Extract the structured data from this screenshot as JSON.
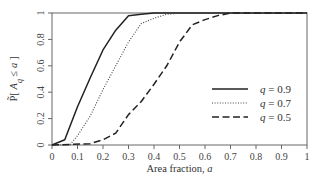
{
  "chart_data": {
    "type": "line",
    "title": "",
    "xlabel": "Area fraction, a",
    "xlabel_parts": {
      "text": "Area fraction, ",
      "var": "a"
    },
    "ylabel": "P̃[ A_q ≤ a ]",
    "ylabel_parts": {
      "prefix": "P̃[ ",
      "var": "A",
      "sub": "q",
      "mid": " ≤ ",
      "var2": "a",
      "suffix": " ]"
    },
    "xlim": [
      0,
      1
    ],
    "ylim": [
      0,
      1
    ],
    "xticks": [
      0,
      0.1,
      0.2,
      0.3,
      0.4,
      0.5,
      0.6,
      0.7,
      0.8,
      0.9,
      1
    ],
    "xtick_labels": [
      "0",
      "0.1",
      "0.2",
      "0.3",
      "0.4",
      "0.5",
      "0.6",
      "0.7",
      "0.8",
      "0.9",
      "1"
    ],
    "yticks": [
      0,
      0.2,
      0.4,
      0.6,
      0.8,
      1
    ],
    "ytick_labels": [
      "0",
      "0.2",
      "0.4",
      "0.6",
      "0.8",
      "1"
    ],
    "grid": false,
    "legend_position": "center-right",
    "series": [
      {
        "name": "q = 0.9",
        "legend_var": "q",
        "legend_value": "= 0.9",
        "style": "solid",
        "color": "#222222",
        "x": [
          0,
          0.05,
          0.1,
          0.15,
          0.2,
          0.25,
          0.3,
          0.35,
          0.4,
          1
        ],
        "y": [
          0,
          0.04,
          0.29,
          0.51,
          0.72,
          0.87,
          0.98,
          0.99,
          1.0,
          1.0
        ]
      },
      {
        "name": "q = 0.7",
        "legend_var": "q",
        "legend_value": "= 0.7",
        "style": "dotted",
        "color": "#444444",
        "x": [
          0,
          0.07,
          0.1,
          0.15,
          0.2,
          0.25,
          0.3,
          0.35,
          0.4,
          0.45,
          0.5,
          1
        ],
        "y": [
          0,
          0.0,
          0.07,
          0.22,
          0.42,
          0.6,
          0.78,
          0.92,
          0.96,
          0.99,
          1.0,
          1.0
        ]
      },
      {
        "name": "q = 0.5",
        "legend_var": "q",
        "legend_value": "= 0.5",
        "style": "dashed",
        "color": "#222222",
        "x": [
          0,
          0.15,
          0.2,
          0.25,
          0.3,
          0.35,
          0.4,
          0.45,
          0.5,
          0.55,
          0.6,
          0.65,
          0.7,
          1
        ],
        "y": [
          0,
          0.01,
          0.04,
          0.09,
          0.23,
          0.33,
          0.46,
          0.6,
          0.78,
          0.91,
          0.95,
          0.98,
          1.0,
          1.0
        ]
      }
    ]
  }
}
